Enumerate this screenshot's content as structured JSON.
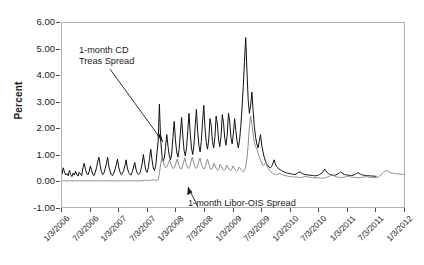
{
  "chart_data": {
    "type": "line",
    "title": "",
    "subtitle": "",
    "xlabel": "",
    "ylabel": "Percent",
    "ylim": [
      -1.0,
      6.0
    ],
    "ytick_values": [
      6.0,
      5.0,
      4.0,
      3.0,
      2.0,
      1.0,
      0.0,
      -1.0
    ],
    "ytick_labels": [
      "6.00",
      "5.00",
      "4.00",
      "3.00",
      "2.00",
      "1.00",
      "0.00",
      "-1.00"
    ],
    "grid": false,
    "legend_position": "none",
    "xtick_labels": [
      "1/3/2006",
      "7/3/2006",
      "1/3/2007",
      "7/3/2007",
      "1/3/2008",
      "7/3/2008",
      "1/3/2009",
      "7/3/2009",
      "1/3/2010",
      "7/3/2010",
      "1/3/2011",
      "7/3/2011",
      "1/3/2012"
    ],
    "xlim_labels": [
      "1/3/2006",
      "1/3/2012"
    ],
    "annotations": [
      {
        "text_line1": "1-month CD",
        "text_line2": "Treas Spread",
        "series": "cd-treas-spread",
        "arrow": "down-right"
      },
      {
        "text_line1": "1-month Libor-OIS Spread",
        "text_line2": "",
        "series": "libor-ois-spread",
        "arrow": "up-left"
      }
    ],
    "series": [
      {
        "name": "1-month CD Treas Spread",
        "color": "#111111",
        "linewidth": 1.0,
        "x_start": "1/3/2006",
        "x_end": "7/3/2011",
        "values": [
          0.3,
          0.55,
          0.4,
          0.28,
          0.33,
          0.25,
          0.45,
          0.3,
          0.22,
          0.35,
          0.28,
          0.42,
          0.3,
          0.24,
          0.38,
          0.32,
          0.26,
          0.55,
          0.72,
          0.5,
          0.33,
          0.28,
          0.4,
          0.62,
          0.45,
          0.3,
          0.26,
          0.38,
          0.55,
          0.8,
          0.95,
          0.62,
          0.4,
          0.3,
          0.35,
          0.52,
          0.7,
          0.95,
          0.6,
          0.42,
          0.3,
          0.26,
          0.35,
          0.48,
          0.66,
          0.88,
          0.58,
          0.4,
          0.3,
          0.33,
          0.45,
          0.62,
          0.85,
          0.55,
          0.38,
          0.3,
          0.28,
          0.4,
          0.58,
          0.75,
          0.5,
          0.35,
          0.3,
          0.33,
          0.48,
          0.7,
          1.05,
          0.72,
          0.45,
          0.38,
          0.55,
          0.9,
          1.25,
          0.85,
          0.55,
          0.45,
          0.62,
          1.1,
          1.55,
          2.95,
          1.6,
          1.05,
          0.8,
          0.92,
          1.35,
          1.8,
          1.35,
          1.0,
          0.85,
          1.1,
          1.7,
          2.3,
          1.6,
          1.15,
          0.95,
          1.25,
          1.85,
          2.45,
          1.75,
          1.2,
          1.0,
          1.3,
          1.95,
          2.6,
          1.85,
          1.3,
          1.05,
          1.4,
          2.1,
          2.75,
          1.95,
          1.4,
          1.15,
          1.55,
          2.3,
          2.9,
          2.05,
          1.5,
          1.25,
          1.6,
          2.4,
          2.15,
          1.55,
          1.3,
          1.7,
          2.5,
          2.2,
          1.6,
          1.35,
          1.75,
          2.55,
          2.25,
          1.65,
          1.4,
          1.8,
          2.6,
          2.3,
          1.7,
          1.45,
          1.85,
          2.4,
          1.95,
          1.55,
          1.3,
          1.6,
          2.1,
          2.8,
          3.6,
          4.55,
          5.45,
          4.2,
          3.1,
          2.6,
          2.9,
          3.4,
          2.7,
          2.1,
          1.7,
          1.45,
          1.3,
          1.55,
          1.8,
          1.4,
          1.15,
          0.95,
          0.8,
          0.7,
          0.62,
          0.58,
          0.55,
          0.6,
          0.72,
          0.85,
          0.7,
          0.6,
          0.55,
          0.5,
          0.48,
          0.45,
          0.42,
          0.4,
          0.38,
          0.36,
          0.35,
          0.34,
          0.33,
          0.32,
          0.31,
          0.3,
          0.3,
          0.32,
          0.35,
          0.38,
          0.4,
          0.36,
          0.33,
          0.31,
          0.3,
          0.29,
          0.28,
          0.28,
          0.27,
          0.27,
          0.26,
          0.26,
          0.25,
          0.25,
          0.26,
          0.28,
          0.3,
          0.33,
          0.36,
          0.42,
          0.5,
          0.44,
          0.38,
          0.34,
          0.31,
          0.29,
          0.28,
          0.27,
          0.27,
          0.28,
          0.3,
          0.33,
          0.36,
          0.4,
          0.36,
          0.32,
          0.3,
          0.29,
          0.28,
          0.27,
          0.27,
          0.26,
          0.26,
          0.27,
          0.29,
          0.31,
          0.34,
          0.37,
          0.34,
          0.31,
          0.29,
          0.28,
          0.27,
          0.26,
          0.26,
          0.25,
          0.25,
          0.25,
          0.24,
          0.24,
          0.24,
          0.23,
          0.23
        ]
      },
      {
        "name": "1-month Libor-OIS Spread",
        "color": "#8c8c8c",
        "linewidth": 1.0,
        "x_start": "1/3/2006",
        "x_end": "1/3/2012",
        "values": [
          0.06,
          0.06,
          0.06,
          0.06,
          0.06,
          0.06,
          0.06,
          0.06,
          0.06,
          0.06,
          0.06,
          0.06,
          0.06,
          0.06,
          0.06,
          0.06,
          0.06,
          0.06,
          0.06,
          0.06,
          0.06,
          0.06,
          0.06,
          0.06,
          0.06,
          0.06,
          0.06,
          0.06,
          0.06,
          0.06,
          0.06,
          0.06,
          0.06,
          0.06,
          0.06,
          0.06,
          0.06,
          0.06,
          0.06,
          0.06,
          0.06,
          0.06,
          0.06,
          0.06,
          0.06,
          0.06,
          0.06,
          0.06,
          0.06,
          0.06,
          0.06,
          0.06,
          0.06,
          0.06,
          0.06,
          0.06,
          0.06,
          0.06,
          0.06,
          0.06,
          0.06,
          0.06,
          0.06,
          0.06,
          0.07,
          0.08,
          0.09,
          0.08,
          0.07,
          0.07,
          0.08,
          0.09,
          0.1,
          0.09,
          0.08,
          0.08,
          0.1,
          0.35,
          0.72,
          0.95,
          0.78,
          0.62,
          0.55,
          0.6,
          0.72,
          0.85,
          0.7,
          0.58,
          0.52,
          0.58,
          0.72,
          0.88,
          0.7,
          0.58,
          0.5,
          0.58,
          0.75,
          0.92,
          0.72,
          0.58,
          0.52,
          0.6,
          0.8,
          0.95,
          0.75,
          0.6,
          0.52,
          0.58,
          0.78,
          0.92,
          0.72,
          0.58,
          0.5,
          0.56,
          0.74,
          0.88,
          0.68,
          0.55,
          0.48,
          0.55,
          0.72,
          0.62,
          0.52,
          0.46,
          0.52,
          0.68,
          0.6,
          0.5,
          0.45,
          0.5,
          0.65,
          0.58,
          0.48,
          0.44,
          0.48,
          0.62,
          0.55,
          0.46,
          0.42,
          0.46,
          0.58,
          0.52,
          0.45,
          0.4,
          0.44,
          0.56,
          0.85,
          1.35,
          2.05,
          2.5,
          2.2,
          1.8,
          1.5,
          1.35,
          1.25,
          1.1,
          0.95,
          0.82,
          0.7,
          0.62,
          0.68,
          0.75,
          0.62,
          0.52,
          0.45,
          0.4,
          0.36,
          0.33,
          0.31,
          0.3,
          0.3,
          0.32,
          0.34,
          0.31,
          0.29,
          0.27,
          0.26,
          0.25,
          0.24,
          0.23,
          0.22,
          0.22,
          0.21,
          0.21,
          0.2,
          0.2,
          0.2,
          0.19,
          0.19,
          0.19,
          0.2,
          0.21,
          0.22,
          0.23,
          0.21,
          0.2,
          0.19,
          0.19,
          0.18,
          0.18,
          0.18,
          0.17,
          0.17,
          0.17,
          0.17,
          0.16,
          0.16,
          0.17,
          0.18,
          0.19,
          0.21,
          0.23,
          0.26,
          0.3,
          0.27,
          0.24,
          0.22,
          0.21,
          0.2,
          0.19,
          0.19,
          0.18,
          0.19,
          0.2,
          0.21,
          0.22,
          0.24,
          0.22,
          0.21,
          0.2,
          0.19,
          0.19,
          0.18,
          0.18,
          0.18,
          0.17,
          0.18,
          0.19,
          0.2,
          0.21,
          0.22,
          0.21,
          0.2,
          0.19,
          0.19,
          0.18,
          0.18,
          0.18,
          0.18,
          0.19,
          0.21,
          0.24,
          0.28,
          0.33,
          0.38,
          0.42,
          0.45,
          0.44,
          0.41,
          0.38,
          0.36,
          0.35,
          0.34,
          0.33,
          0.33,
          0.32,
          0.32,
          0.31,
          0.31,
          0.31,
          0.3,
          0.3
        ]
      }
    ]
  },
  "axes": {
    "y_title": "Percent"
  }
}
